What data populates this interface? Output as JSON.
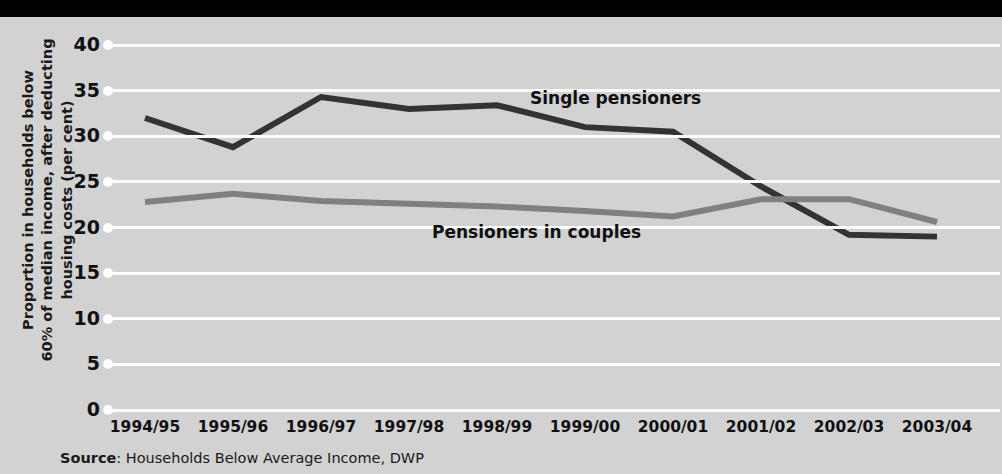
{
  "chart_data": {
    "type": "line",
    "title": "",
    "xlabel": "",
    "ylabel": "Proportion in households below 60% of median income, after deducting housing costs (per cent)",
    "ylabel_lines": [
      "Proportion in households below",
      "60% of median income, after deducting",
      "housing costs (per cent)"
    ],
    "categories": [
      "1994/95",
      "1995/96",
      "1996/97",
      "1997/98",
      "1998/99",
      "1999/00",
      "2000/01",
      "2001/02",
      "2002/03",
      "2003/04"
    ],
    "yticks": [
      0,
      5,
      10,
      15,
      20,
      25,
      30,
      35,
      40
    ],
    "ylim": [
      0,
      40
    ],
    "grid": true,
    "legend_position": "inline-annotations",
    "series": [
      {
        "name": "Single pensioners",
        "color": "#333333",
        "values": [
          32.0,
          28.8,
          34.3,
          33.0,
          33.4,
          31.0,
          30.5,
          24.5,
          19.2,
          19.0
        ]
      },
      {
        "name": "Pensioners in couples",
        "color": "#808080",
        "values": [
          22.8,
          23.7,
          22.9,
          22.6,
          22.3,
          21.8,
          21.2,
          23.1,
          23.1,
          20.6
        ]
      }
    ],
    "annotations": [
      {
        "text": "Single pensioners",
        "target_series": "Single pensioners"
      },
      {
        "text": "Pensioners in couples",
        "target_series": "Pensioners in couples"
      }
    ]
  },
  "source": {
    "prefix": "Source",
    "separator": ":",
    "text": "Households Below Average Income, DWP",
    "full": "Source: Households Below Average Income, DWP"
  },
  "colors": {
    "background": "#d2d2d2",
    "top_band": "#000000",
    "gridline": "#fdfdfd",
    "series_single": "#333333",
    "series_couples": "#808080",
    "text": "#101010"
  }
}
